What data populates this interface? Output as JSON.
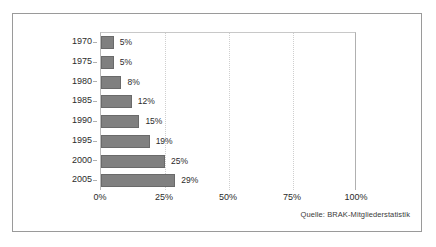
{
  "chart_data": {
    "type": "bar",
    "orientation": "horizontal",
    "title": "",
    "subtitle": "",
    "xlabel": "",
    "ylabel": "",
    "categories": [
      "1970",
      "1975",
      "1980",
      "1985",
      "1990",
      "1995",
      "2000",
      "2005"
    ],
    "values": [
      5,
      5,
      8,
      12,
      15,
      19,
      25,
      29
    ],
    "value_labels": [
      "5%",
      "5%",
      "8%",
      "12%",
      "15%",
      "19%",
      "25%",
      "29%"
    ],
    "xlim": [
      0,
      100
    ],
    "xticks": [
      0,
      25,
      50,
      75,
      100
    ],
    "xtick_labels": [
      "0%",
      "25%",
      "50%",
      "75%",
      "100%"
    ],
    "grid": "vertical-dotted",
    "legend": "none",
    "annotations": [
      "Quelle: BRAK-Mitgliederstatistik"
    ],
    "bar_color": "#808080",
    "bar_border_color": "#6a6a6a",
    "gridline_color": "#cfcfcf",
    "frame_color": "#9a9a9a",
    "background_color": "#ffffff"
  },
  "source_note": "Quelle: BRAK-Mitgliederstatistik"
}
